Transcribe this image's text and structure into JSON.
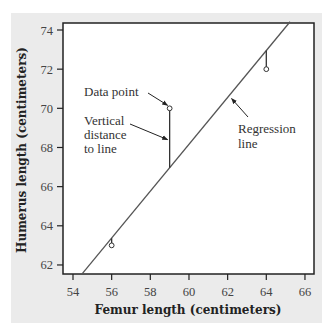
{
  "chart_data": {
    "type": "scatter",
    "title": "",
    "xlabel": "Femur length (centimeters)",
    "ylabel": "Humerus length (centimeters)",
    "xlim": [
      53.5,
      66.5
    ],
    "ylim": [
      61.5,
      74.4
    ],
    "x_ticks": [
      54,
      56,
      58,
      60,
      62,
      64,
      66
    ],
    "y_ticks": [
      62,
      64,
      66,
      68,
      70,
      72,
      74
    ],
    "grid": false,
    "legend": null,
    "points": [
      {
        "x": 56,
        "y": 63
      },
      {
        "x": 59,
        "y": 70
      },
      {
        "x": 64,
        "y": 72
      }
    ],
    "regression_line": {
      "intercept": -3.66,
      "slope": 1.197,
      "x_range": [
        54.47,
        65.23
      ]
    },
    "residual_segments": [
      {
        "x": 56,
        "y_point": 63,
        "y_line": 63.37
      },
      {
        "x": 59,
        "y_point": 70,
        "y_line": 66.96
      },
      {
        "x": 64,
        "y_point": 72,
        "y_line": 72.95
      }
    ],
    "annotations": [
      {
        "text": "Data point",
        "target": {
          "x": 59,
          "y": 70
        }
      },
      {
        "text": [
          "Vertical",
          "distance",
          "to line"
        ],
        "target": {
          "x": 59,
          "y": 68.4
        }
      },
      {
        "text": [
          "Regression",
          "line"
        ],
        "target": {
          "x": 62.1,
          "y": 70.6
        }
      }
    ]
  },
  "colors": {
    "panel_background": "#ebebeb",
    "plot_background": "#ffffff",
    "frame": "#222222",
    "line": "#555555"
  }
}
